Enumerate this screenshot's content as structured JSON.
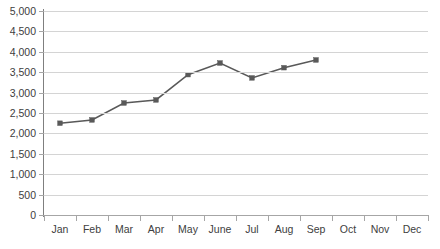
{
  "chart_data": {
    "type": "line",
    "title": "",
    "subtitle": "",
    "xlabel": "",
    "ylabel": "",
    "categories": [
      "Jan",
      "Feb",
      "Mar",
      "Apr",
      "May",
      "June",
      "Jul",
      "Aug",
      "Sep",
      "Oct",
      "Nov",
      "Dec"
    ],
    "series": [
      {
        "name": "Series 1",
        "color": "#595959",
        "marker": "square",
        "values": [
          2250,
          2330,
          2745,
          2820,
          3440,
          3725,
          3360,
          3610,
          3800,
          null,
          null,
          null
        ]
      }
    ],
    "ylim": [
      0,
      5000
    ],
    "ytick_step": 500,
    "ytick_labels": [
      "0",
      "500",
      "1,000",
      "1,500",
      "2,000",
      "2,500",
      "3,000",
      "3,500",
      "4,000",
      "4,500",
      "5,000"
    ],
    "ytick_values": [
      0,
      500,
      1000,
      1500,
      2000,
      2500,
      3000,
      3500,
      4000,
      4500,
      5000
    ],
    "grid": {
      "horizontal": true,
      "vertical": false,
      "color": "#d4d4d4"
    },
    "legend": {
      "visible": false,
      "position": "none"
    },
    "axis_colors": {
      "value_axis": "#7f7f7f",
      "category_axis": "#a6a6a6",
      "tick_label": "#404040"
    },
    "background": "#ffffff"
  }
}
